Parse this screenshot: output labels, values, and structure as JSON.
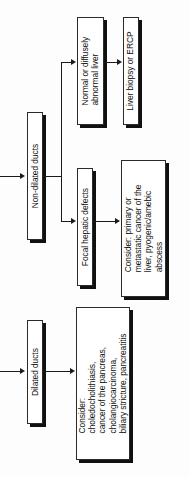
{
  "diagram": {
    "orientation": "rotated-90-ccw",
    "colors": {
      "background": "#fdfdfd",
      "box_fill": "#ffffff",
      "box_border": "#2b2b2b",
      "box_shadow": "#101010",
      "connector": "#1a1a1a",
      "text": "#0d0d0d"
    },
    "nodes": {
      "non_dilated_ducts": "Non-dilated ducts",
      "dilated_ducts": "Dilated ducts",
      "normal_or_diffuse": "Normal or diffusely\nabnormal liver",
      "liver_biopsy_ercp": "Liver biopsy or ERCP",
      "focal_hepatic_defects": "Focal hepatic defects",
      "consider_focal": "Consider: primary or\nmetastatic cancer of the\nliver, pyogenic/amebic\nabscess",
      "consider_dilated": "Consider:\ncholedocholithiasis,\ncancer of the pancreas,\ncholangiocarcinoma,\nbiliary stricture, pancreatitis"
    },
    "edges": [
      {
        "name": "entry-to-non-dilated-ducts",
        "from": "(off-screen left)",
        "to": "Non-dilated ducts"
      },
      {
        "name": "entry-to-dilated-ducts",
        "from": "(off-screen left)",
        "to": "Dilated ducts"
      },
      {
        "name": "non-dilated-to-normal-liver",
        "from": "Non-dilated ducts",
        "to": "Normal or diffusely abnormal liver"
      },
      {
        "name": "non-dilated-to-focal-defects",
        "from": "Non-dilated ducts",
        "to": "Focal hepatic defects"
      },
      {
        "name": "normal-liver-to-biopsy",
        "from": "Normal or diffusely abnormal liver",
        "to": "Liver biopsy or ERCP"
      },
      {
        "name": "focal-defects-to-consider",
        "from": "Focal hepatic defects",
        "to": "Consider: primary or metastatic cancer of the liver, pyogenic/amebic abscess"
      },
      {
        "name": "dilated-to-consider",
        "from": "Dilated ducts",
        "to": "Consider: choledocholithiasis, cancer of the pancreas, cholangiocarcinoma, biliary stricture, pancreatitis"
      }
    ]
  }
}
